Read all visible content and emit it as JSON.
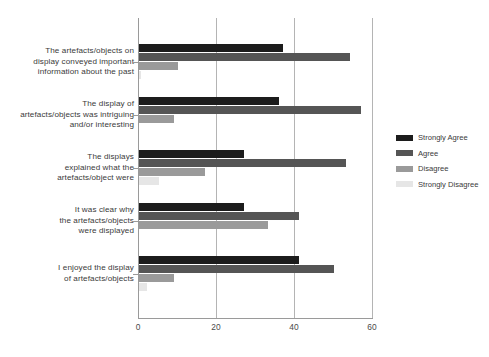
{
  "chart_data": {
    "type": "bar",
    "orientation": "horizontal",
    "title": "",
    "xlabel": "",
    "ylabel": "",
    "xlim": [
      0,
      60
    ],
    "xticks": [
      0,
      20,
      40,
      60
    ],
    "grid": true,
    "legend_position": "right",
    "categories": [
      "The artefacts/objects on display conveyed important information about the past",
      "The display of artefacts/objects was intriguing and/or interesting",
      "The displays explained what the artefacts/object were",
      "It was clear why the artefacts/objects were displayed",
      "I enjoyed the display of artefacts/objects"
    ],
    "category_lines": [
      [
        "The artefacts/objects on",
        "display conveyed important",
        "information about the past"
      ],
      [
        "The display of",
        "artefacts/objects was intriguing",
        "and/or interesting"
      ],
      [
        "The displays",
        "explained what the",
        "artefacts/object were"
      ],
      [
        "It was clear why",
        "the artefacts/objects",
        "were displayed"
      ],
      [
        "I enjoyed the display",
        "of artefacts/objects"
      ]
    ],
    "series": [
      {
        "name": "Strongly Agree",
        "color": "#1c1c1c",
        "values": [
          37,
          36,
          27,
          27,
          41
        ]
      },
      {
        "name": "Agree",
        "color": "#555555",
        "values": [
          54,
          57,
          53,
          41,
          50
        ]
      },
      {
        "name": "Disagree",
        "color": "#9a9a9a",
        "values": [
          10,
          9,
          17,
          33,
          9
        ]
      },
      {
        "name": "Strongly Disagree",
        "color": "#e6e6e6",
        "values": [
          0.5,
          0,
          5,
          0,
          2
        ]
      }
    ]
  },
  "legend": {
    "items": [
      {
        "label": "Strongly Agree",
        "color": "#1c1c1c"
      },
      {
        "label": "Agree",
        "color": "#555555"
      },
      {
        "label": "Disagree",
        "color": "#9a9a9a"
      },
      {
        "label": "Strongly Disagree",
        "color": "#e6e6e6"
      }
    ]
  },
  "axis": {
    "x_tick_labels": [
      "0",
      "20",
      "40",
      "60"
    ]
  }
}
